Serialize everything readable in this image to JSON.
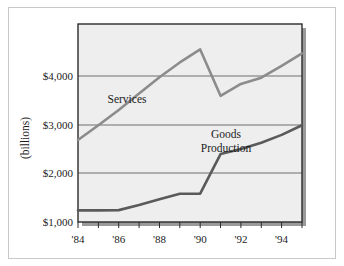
{
  "chart_data": {
    "type": "line",
    "title": "",
    "xlabel": "",
    "ylabel": "(billions)",
    "xlim": [
      1984,
      1995
    ],
    "ylim": [
      1000,
      4500
    ],
    "grid": true,
    "grid_axis": "y",
    "legend": "inline-labels",
    "ytick_labels": [
      "$1,000",
      "$2,000",
      "$3,000",
      "$4,000"
    ],
    "ytick_values": [
      1000,
      2000,
      3000,
      4000
    ],
    "xtick_labels": [
      "'84",
      "'86",
      "'88",
      "'90",
      "'92",
      "'94"
    ],
    "xtick_values": [
      1984,
      1986,
      1988,
      1990,
      1992,
      1994
    ],
    "x_minor_ticks": [
      1984,
      1985,
      1986,
      1987,
      1988,
      1989,
      1990,
      1991,
      1992,
      1993,
      1994,
      1995
    ],
    "x": [
      1984,
      1985,
      1986,
      1987,
      1988,
      1989,
      1990,
      1991,
      1992,
      1993,
      1994,
      1995
    ],
    "series": [
      {
        "name": "Services",
        "color": "#8c8c8c",
        "values": [
          2450,
          2710,
          2980,
          3270,
          3560,
          3820,
          4050,
          3230,
          3440,
          3550,
          3760,
          3980
        ]
      },
      {
        "name": "Goods Production",
        "color": "#5a5a5a",
        "values": [
          1205,
          1205,
          1210,
          1300,
          1400,
          1500,
          1500,
          2200,
          2290,
          2400,
          2540,
          2710
        ]
      }
    ],
    "annotations": [
      {
        "text": "Services",
        "x": 1986.2,
        "y": 3720
      },
      {
        "text": "Goods",
        "x": 1990.4,
        "y": 2790
      },
      {
        "text": "Production",
        "x": 1990.4,
        "y": 2560
      }
    ]
  },
  "colors": {
    "plot_background": "#eeeeee",
    "plot_border": "#2b2b2b",
    "gridline": "#6e6e6e",
    "shadow": "#9a9a9a",
    "page_background": "#ffffff",
    "frame_border": "#c9c9c9",
    "text": "#1b1b1b"
  },
  "axis": {
    "y_title": "(billions)",
    "y_labels": [
      "$4,000",
      "$3,000",
      "$2,000",
      "$1,000"
    ],
    "x_labels": [
      "'84",
      "'86",
      "'88",
      "'90",
      "'92",
      "'94"
    ]
  },
  "series_labels": {
    "services": "Services",
    "goods_line1": "Goods",
    "goods_line2": "Production"
  }
}
